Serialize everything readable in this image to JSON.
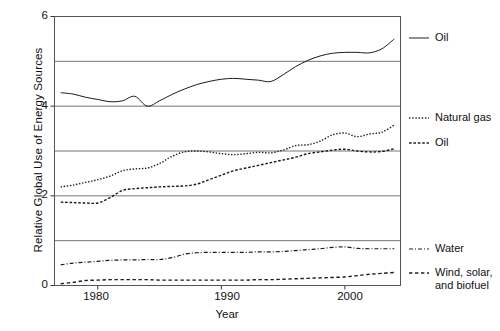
{
  "chart_data": {
    "type": "line",
    "title": "",
    "xlabel": "Year",
    "ylabel": "Relative Global Use of Energy Sources",
    "xlim": [
      1976.5,
      2004.5
    ],
    "ylim": [
      0,
      6
    ],
    "xticks": [
      1980,
      1990,
      2000
    ],
    "xtick_labels": [
      "1980",
      "1990",
      "2000"
    ],
    "yticks": [
      0,
      2,
      4,
      6
    ],
    "ytick_labels": [
      "0",
      "2",
      "4",
      "6"
    ],
    "gridlines": [
      0,
      1,
      2,
      3,
      4,
      5,
      6
    ],
    "grid": true,
    "legend_position": "right",
    "x": [
      1977,
      1978,
      1979,
      1980,
      1981,
      1982,
      1983,
      1984,
      1985,
      1986,
      1987,
      1988,
      1989,
      1990,
      1991,
      1992,
      1993,
      1994,
      1995,
      1996,
      1997,
      1998,
      1999,
      2000,
      2001,
      2002,
      2003,
      2004
    ],
    "series": [
      {
        "name": "Oil",
        "style": "solid",
        "values": [
          4.3,
          4.27,
          4.2,
          4.15,
          4.1,
          4.12,
          4.22,
          4.0,
          4.12,
          4.26,
          4.38,
          4.48,
          4.55,
          4.6,
          4.62,
          4.6,
          4.58,
          4.55,
          4.7,
          4.88,
          5.02,
          5.12,
          5.18,
          5.2,
          5.2,
          5.19,
          5.28,
          5.5
        ]
      },
      {
        "name": "Natural gas",
        "style": "dotted",
        "values": [
          2.2,
          2.24,
          2.3,
          2.36,
          2.44,
          2.56,
          2.6,
          2.62,
          2.72,
          2.88,
          2.98,
          3.0,
          2.98,
          2.94,
          2.92,
          2.94,
          2.97,
          2.96,
          3.02,
          3.12,
          3.14,
          3.22,
          3.36,
          3.4,
          3.32,
          3.38,
          3.42,
          3.58
        ]
      },
      {
        "name": "Oil",
        "style": "dashed",
        "values": [
          1.86,
          1.85,
          1.84,
          1.84,
          1.96,
          2.12,
          2.16,
          2.18,
          2.2,
          2.21,
          2.22,
          2.26,
          2.36,
          2.46,
          2.56,
          2.62,
          2.68,
          2.74,
          2.8,
          2.86,
          2.94,
          2.98,
          3.02,
          3.04,
          3.0,
          2.98,
          2.99,
          3.05
        ]
      },
      {
        "name": "Water",
        "style": "dashdot",
        "values": [
          0.46,
          0.5,
          0.52,
          0.54,
          0.56,
          0.57,
          0.57,
          0.58,
          0.58,
          0.62,
          0.7,
          0.73,
          0.74,
          0.74,
          0.74,
          0.74,
          0.75,
          0.75,
          0.76,
          0.78,
          0.8,
          0.82,
          0.85,
          0.86,
          0.83,
          0.82,
          0.82,
          0.82
        ]
      },
      {
        "name": "Wind, solar, and biofuel",
        "style": "shortdash",
        "values": [
          0.04,
          0.07,
          0.11,
          0.12,
          0.13,
          0.13,
          0.13,
          0.13,
          0.12,
          0.12,
          0.12,
          0.12,
          0.12,
          0.12,
          0.12,
          0.12,
          0.13,
          0.13,
          0.14,
          0.15,
          0.16,
          0.17,
          0.18,
          0.19,
          0.22,
          0.25,
          0.27,
          0.29
        ]
      }
    ]
  },
  "legend": [
    {
      "label": "Oil",
      "style": "solid"
    },
    {
      "label": "Natural gas",
      "style": "dotted"
    },
    {
      "label": "Oil",
      "style": "dashed"
    },
    {
      "label": "Water",
      "style": "dashdot"
    },
    {
      "label": "Wind, solar,\nand biofuel",
      "style": "shortdash"
    }
  ],
  "axes": {
    "ylabel": "Relative Global Use of Energy Sources",
    "xlabel": "Year",
    "ytick_labels": [
      "0",
      "2",
      "4",
      "6"
    ],
    "xtick_labels": [
      "1980",
      "1990",
      "2000"
    ]
  }
}
